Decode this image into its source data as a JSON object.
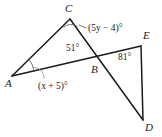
{
  "figure": {
    "background_color": "#ffffff",
    "stroke_color": "#1a1a1a",
    "width": 162,
    "height": 137
  },
  "vertices": [
    {
      "id": "A",
      "label": "A",
      "x": 12,
      "y": 76,
      "label_x": 5,
      "label_y": 78
    },
    {
      "id": "B",
      "label": "B",
      "x": 96,
      "y": 62,
      "label_x": 91,
      "label_y": 64
    },
    {
      "id": "C",
      "label": "C",
      "x": 70,
      "y": 19,
      "label_x": 65,
      "label_y": 3
    },
    {
      "id": "D",
      "label": "D",
      "x": 143,
      "y": 120,
      "label_x": 145,
      "label_y": 122
    },
    {
      "id": "E",
      "label": "E",
      "x": 141,
      "y": 46,
      "label_x": 143,
      "label_y": 30
    }
  ],
  "segments": [
    {
      "name": "segment-A-C",
      "from": "A",
      "to": "C"
    },
    {
      "name": "segment-A-E",
      "from": "A",
      "to": "E"
    },
    {
      "name": "segment-C-D",
      "from": "C",
      "to": "D"
    },
    {
      "name": "segment-E-D",
      "from": "E",
      "to": "D"
    }
  ],
  "angles": [
    {
      "id": "angle-at-C",
      "vertex": "C",
      "text": "(5y − 4)°",
      "expr_prefix": "(",
      "expr_var": "5y",
      "expr_suffix": " − 4)°",
      "label_x": 88,
      "label_y": 24,
      "has_arc": true,
      "has_leader": true
    },
    {
      "id": "angle-at-B",
      "vertex": "B",
      "text": "51°",
      "label_x": 66,
      "label_y": 44,
      "has_arc": false,
      "has_leader": false
    },
    {
      "id": "angle-at-A",
      "vertex": "A",
      "text": "(x + 5)°",
      "expr_prefix": "(",
      "expr_var": "x",
      "expr_suffix": " + 5)°",
      "label_x": 38,
      "label_y": 82,
      "has_arc": true,
      "has_leader": true
    },
    {
      "id": "angle-at-E",
      "vertex": "E",
      "text": "81°",
      "label_x": 118,
      "label_y": 53,
      "has_arc": false,
      "has_leader": false
    }
  ]
}
